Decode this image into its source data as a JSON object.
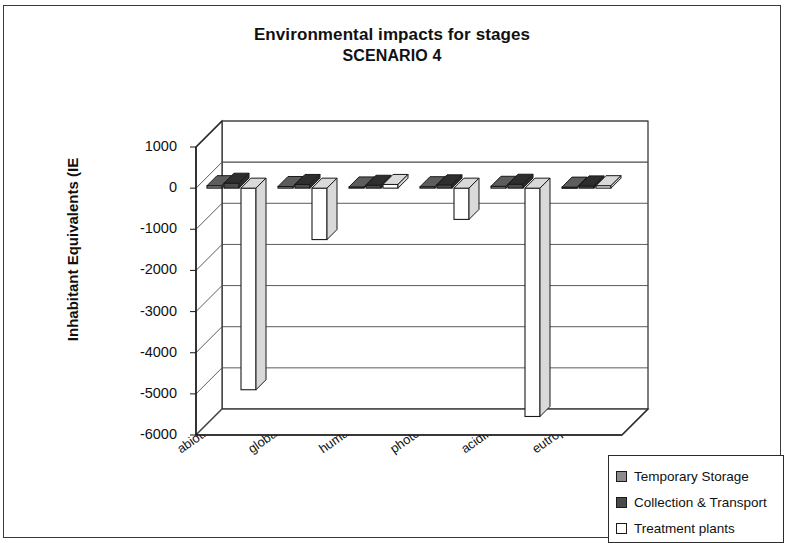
{
  "chart_data": {
    "type": "bar",
    "title": "Environmental impacts for stages",
    "subtitle": "SCENARIO 4",
    "xlabel": "",
    "ylabel": "Inhabitant Equivalents (IE",
    "ylim": [
      -6000,
      1000
    ],
    "ytick_labels": [
      "1000",
      "0",
      "-1000",
      "-2000",
      "-3000",
      "-4000",
      "-5000",
      "-6000"
    ],
    "ytick_values": [
      1000,
      0,
      -1000,
      -2000,
      -3000,
      -4000,
      -5000,
      -6000
    ],
    "grid": true,
    "legend_position": "bottom-right",
    "three_d": true,
    "categories": [
      "abiotic depletion",
      "global warming",
      "human toxicity",
      "photo-oxidation",
      "acidification",
      "eutrophication"
    ],
    "series": [
      {
        "name": "Temporary Storage",
        "color": "#8c8c8c",
        "values": [
          60,
          40,
          30,
          35,
          45,
          25
        ]
      },
      {
        "name": "Collection & Transport",
        "color": "#4a4a4a",
        "values": [
          120,
          90,
          70,
          80,
          95,
          55
        ]
      },
      {
        "name": "Treatment plants",
        "color": "#ffffff",
        "values": [
          -4900,
          -1250,
          90,
          -760,
          -5550,
          60
        ]
      }
    ]
  },
  "legend": {
    "items": [
      {
        "label": "Temporary Storage",
        "color": "#8c8c8c"
      },
      {
        "label": "Collection & Transport",
        "color": "#4a4a4a"
      },
      {
        "label": "Treatment plants",
        "color": "#ffffff"
      }
    ]
  }
}
